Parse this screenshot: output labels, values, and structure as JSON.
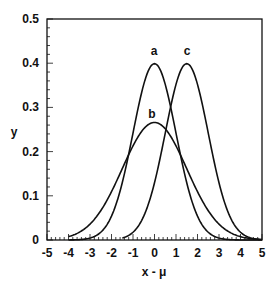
{
  "chart_data": {
    "type": "line",
    "title": "",
    "xlabel": "x - μ",
    "ylabel": "y",
    "xlim": [
      -5,
      5
    ],
    "ylim": [
      0,
      0.5
    ],
    "grid": false,
    "legend": "none (curves labeled inline)",
    "x_ticks": [
      "-5",
      "-4",
      "-3",
      "-2",
      "-1",
      "0",
      "1",
      "2",
      "3",
      "4",
      "5"
    ],
    "y_ticks": [
      "0",
      "0.1",
      "0.2",
      "0.3",
      "0.4",
      "0.5"
    ],
    "series": [
      {
        "name": "a",
        "description": "normal, mean 0, sd 1",
        "mean": 0,
        "sd": 1,
        "peak": 0.4,
        "x_range": [
          -4,
          5
        ]
      },
      {
        "name": "b",
        "description": "normal, mean 0, sd 1.5",
        "mean": 0,
        "sd": 1.5,
        "peak": 0.265,
        "x_range": [
          -4,
          5
        ]
      },
      {
        "name": "c",
        "description": "normal, mean 1.5, sd 1",
        "mean": 1.5,
        "sd": 1,
        "peak": 0.4,
        "x_range": [
          -1.5,
          5
        ]
      }
    ],
    "annotations": [
      {
        "text": "a",
        "x": 0,
        "y": 0.41
      },
      {
        "text": "b",
        "x": 0,
        "y": 0.28
      },
      {
        "text": "c",
        "x": 1.5,
        "y": 0.41
      }
    ]
  },
  "labels": {
    "xlabel": "x - μ",
    "ylabel": "y",
    "a": "a",
    "b": "b",
    "c": "c"
  }
}
